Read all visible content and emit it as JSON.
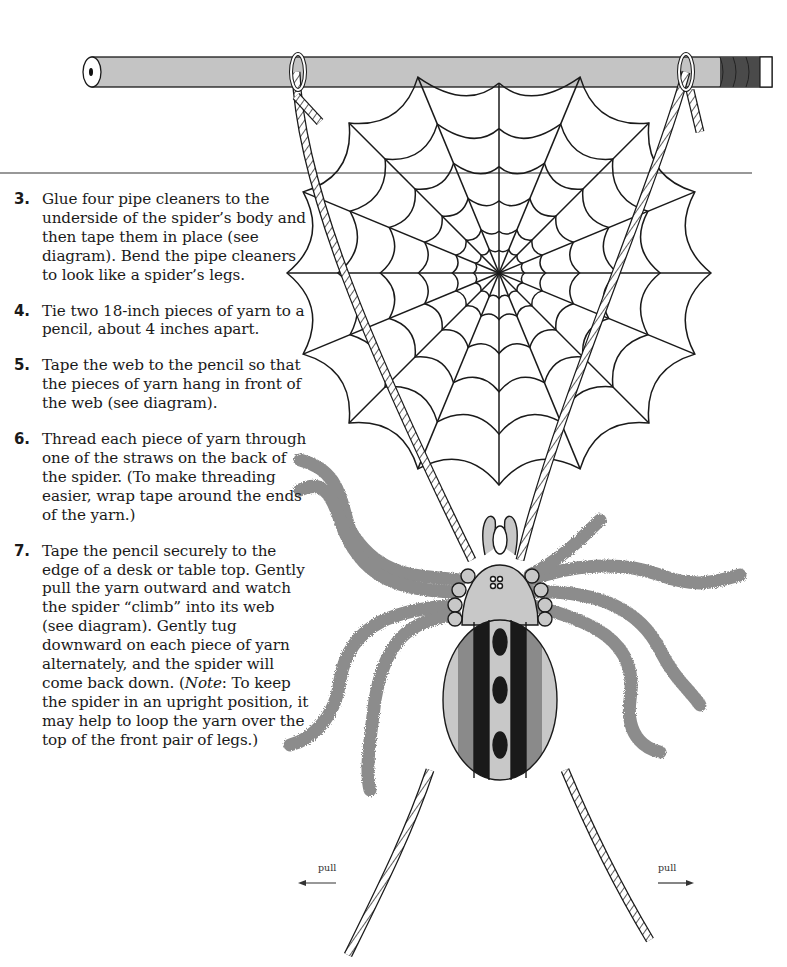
{
  "instructions": {
    "steps": [
      {
        "number": "3.",
        "text": "Glue four pipe cleaners to the underside of the spider’s body and then tape them in place (see diagram). Bend the pipe cleaners to look like a spider’s legs."
      },
      {
        "number": "4.",
        "text": "Tie two 18-inch pieces of yarn to a pencil, about 4 inches apart."
      },
      {
        "number": "5.",
        "text": "Tape the web to the pencil so that the pieces of yarn hang in front of the web (see diagram)."
      },
      {
        "number": "6.",
        "text": "Thread each piece of yarn through one of the straws on the back of the spider. (To make threading easier, wrap tape around the ends of the yarn.)"
      },
      {
        "number": "7.",
        "text_before_note": "Tape the pencil securely to the edge of a desk or table top. Gently pull the yarn outward and watch the spider “climb” into its web (see diagram). Gently tug downward on each piece of yarn alternately, and the spider will come back down. (",
        "note_label": "Note",
        "text_after_note": ": To keep the spider in an upright position, it may help to loop the yarn over the top of the front pair of legs.)"
      }
    ]
  },
  "diagram": {
    "labels": {
      "pull_left": "pull",
      "pull_right": "pull"
    },
    "colors": {
      "pencil_body": "#c4c4c4",
      "pencil_band": "#4a4a4a",
      "pipe_cleaner": "#8c8c8c",
      "body_light": "#c8c8c8",
      "body_mid": "#8a8a8a",
      "body_dark": "#1a1a1a",
      "line": "#1a1a1a"
    }
  }
}
